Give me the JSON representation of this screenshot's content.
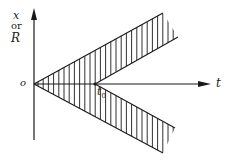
{
  "diagram": {
    "y_axis_label_line1": "x",
    "y_axis_label_line2": "or",
    "y_axis_label_line3": "R",
    "origin_label": "o",
    "x_axis_label": "t",
    "t0_label": "t",
    "t0_subscript": "0",
    "line_color": "#1a1a1a"
  }
}
